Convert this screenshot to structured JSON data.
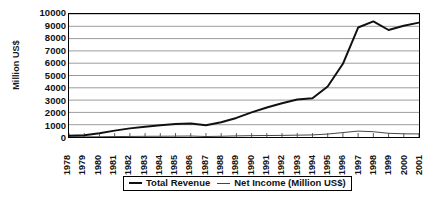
{
  "chart_data": {
    "type": "line",
    "title": "",
    "xlabel": "",
    "ylabel": "Million US$",
    "ylim": [
      0,
      10000
    ],
    "ytick_step": 1000,
    "grid": true,
    "legend_position": "bottom",
    "yticks": [
      "10000",
      "9000",
      "8000",
      "7000",
      "6000",
      "5000",
      "4000",
      "3000",
      "2000",
      "1000",
      "0"
    ],
    "categories": [
      "1978",
      "1979",
      "1980",
      "1981",
      "1982",
      "1983",
      "1984",
      "1985",
      "1986",
      "1987",
      "1988",
      "1989",
      "1990",
      "1991",
      "1992",
      "1993",
      "1994",
      "1995",
      "1996",
      "1997",
      "1998",
      "1999",
      "2000",
      "2001"
    ],
    "series": [
      {
        "name": "Total Revenue",
        "color": "#111111",
        "width": 2,
        "values": [
          100,
          140,
          300,
          520,
          700,
          840,
          960,
          1050,
          1100,
          950,
          1200,
          1550,
          2000,
          2400,
          2750,
          3050,
          3150,
          4100,
          5950,
          8900,
          9400,
          8700,
          9050,
          9300
        ]
      },
      {
        "name": "Net Income (Million US$)",
        "color": "#444444",
        "width": 1,
        "values": [
          10,
          12,
          20,
          35,
          45,
          55,
          60,
          70,
          80,
          40,
          60,
          90,
          110,
          120,
          130,
          150,
          170,
          240,
          360,
          480,
          430,
          300,
          260,
          250
        ]
      }
    ]
  },
  "legend": {
    "items": [
      {
        "label": "Total Revenue",
        "style": "thick"
      },
      {
        "label": "Net Income (Million US$)",
        "style": "thin"
      }
    ]
  }
}
